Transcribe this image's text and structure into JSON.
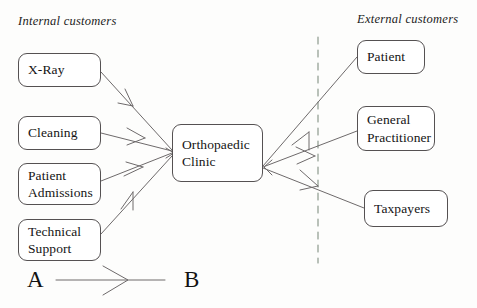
{
  "diagram": {
    "headings": {
      "internal": "Internal customers",
      "external": "External customers"
    },
    "center_node": {
      "line1": "Orthopaedic",
      "line2": "Clinic"
    },
    "internal_nodes": [
      {
        "line1": "X-Ray",
        "line2": ""
      },
      {
        "line1": "Cleaning",
        "line2": ""
      },
      {
        "line1": "Patient",
        "line2": "Admissions"
      },
      {
        "line1": "Technical",
        "line2": "Support"
      }
    ],
    "external_nodes": [
      {
        "line1": "Patient",
        "line2": ""
      },
      {
        "line1": "General",
        "line2": "Practitioner"
      },
      {
        "line1": "Taxpayers",
        "line2": ""
      }
    ],
    "legend": {
      "from": "A",
      "to": "B"
    },
    "colors": {
      "stroke": "#555152",
      "line": "#6e6a6b",
      "text": "#141414",
      "background": "#fdfdfc",
      "divider": "#8d9a8d"
    }
  }
}
